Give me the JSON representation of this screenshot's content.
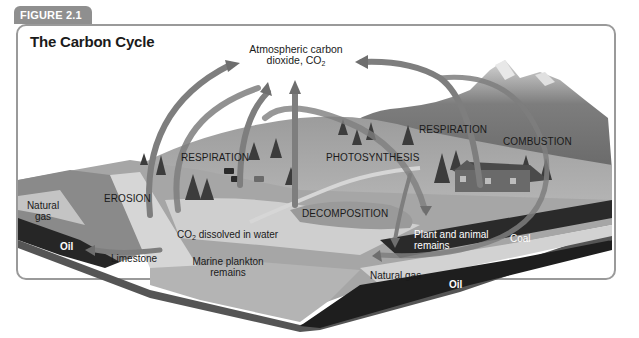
{
  "figure": {
    "tab_label": "FIGURE 2.1",
    "title": "The Carbon Cycle"
  },
  "colors": {
    "tab_bg": "#8f8f8f",
    "frame_border": "#9a9a9a",
    "arrow": "#8a8a8a",
    "sky": "#ffffff",
    "land": "#a8a8a8",
    "water": "#c9c9c9",
    "rock": "#7a7a7a",
    "coal_oil": "#1e1e1e"
  },
  "labels": {
    "atmosphere_line1": "Atmospheric carbon",
    "atmosphere_line2_prefix": "dioxide, CO",
    "atmosphere_line2_sub": "2",
    "respiration_left": "RESPIRATION",
    "photosynthesis": "PHOTOSYNTHESIS",
    "respiration_right": "RESPIRATION",
    "combustion": "COMBUSTION",
    "erosion": "EROSION",
    "decomposition": "DECOMPOSITION",
    "co2_water_prefix": "CO",
    "co2_water_sub": "2",
    "co2_water_suffix": " dissolved in water",
    "natural_gas_left_line1": "Natural",
    "natural_gas_left_line2": "gas",
    "oil_left": "Oil",
    "limestone": "Limestone",
    "marine_plankton_line1": "Marine plankton",
    "marine_plankton_line2": "remains",
    "plant_animal_line1": "Plant and animal",
    "plant_animal_line2": "remains",
    "coal": "Coal",
    "natural_gas_bottom": "Natural gas",
    "oil_bottom": "Oil"
  }
}
